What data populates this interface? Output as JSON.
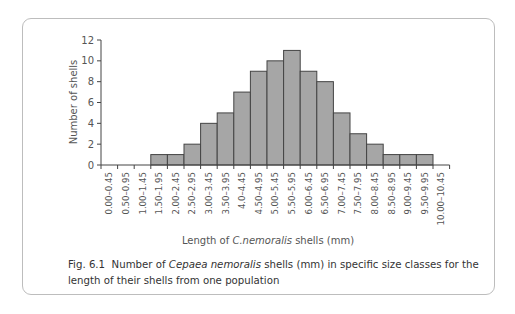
{
  "chart_data": {
    "type": "bar",
    "title": "",
    "xlabel": "Length of C.nemoralis shells (mm)",
    "ylabel": "Number of shells",
    "ylim": [
      0,
      12
    ],
    "yticks": [
      0,
      2,
      4,
      6,
      8,
      10,
      12
    ],
    "grid": false,
    "legend": null,
    "categories": [
      "0.00–0.45",
      "0.50–0.95",
      "1.00–1.45",
      "1.50–1.95",
      "2.00–2.45",
      "2.50–2.95",
      "3.00–3.45",
      "3.50–3.95",
      "4.0–4.45",
      "4.50–4.95",
      "5.00–5.45",
      "5.50–5.95",
      "6.00–6.45",
      "6.50–6.95",
      "7.00–7.45",
      "7.50–7.95",
      "8.00–8.45",
      "8.50–8.95",
      "9.00–9.45",
      "9.50–9.95",
      "10.00–10.45"
    ],
    "values": [
      0,
      0,
      0,
      1,
      1,
      2,
      4,
      5,
      7,
      9,
      10,
      11,
      9,
      8,
      5,
      3,
      2,
      1,
      1,
      1,
      0
    ],
    "bar_color": "#a6a6a6",
    "edge_color": "#444444"
  },
  "caption": {
    "label": "Fig. 6.1",
    "text_before": "Number of ",
    "species": "Cepaea nemoralis",
    "text_after": " shells (mm) in specific size classes for the length of their shells from one population"
  },
  "xlabel_parts": {
    "before": "Length of ",
    "species": "C.nemoralis",
    "after": " shells (mm)"
  }
}
